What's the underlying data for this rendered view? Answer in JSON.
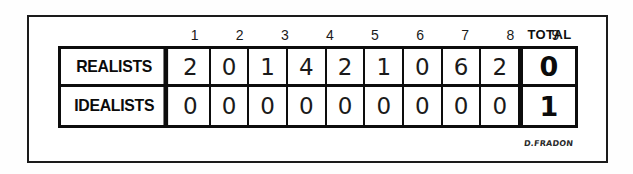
{
  "cartoon": {
    "signature": "D.FRADON"
  },
  "scoreboard": {
    "inning_headers": [
      "1",
      "2",
      "3",
      "4",
      "5",
      "6",
      "7",
      "8",
      "9"
    ],
    "total_header": "TOTAL",
    "rows": [
      {
        "team": "REALISTS",
        "innings": [
          "2",
          "0",
          "1",
          "4",
          "2",
          "1",
          "0",
          "6",
          "2"
        ],
        "total": "0"
      },
      {
        "team": "IDEALISTS",
        "innings": [
          "0",
          "0",
          "0",
          "0",
          "0",
          "0",
          "0",
          "0",
          "0"
        ],
        "total": "1"
      }
    ]
  },
  "colors": {
    "ink": "#0d0d0d",
    "paper": "#ffffff"
  }
}
